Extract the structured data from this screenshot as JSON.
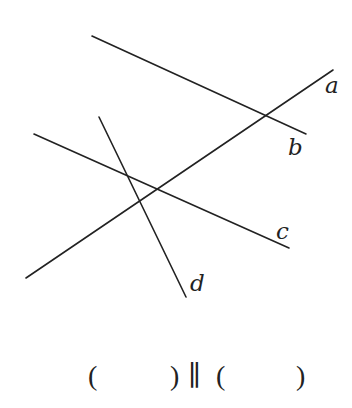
{
  "diagram": {
    "stroke_color": "#222222",
    "lines": [
      {
        "name": "a",
        "x1": 26,
        "y1": 278,
        "x2": 333,
        "y2": 70
      },
      {
        "name": "b",
        "x1": 92,
        "y1": 36,
        "x2": 306,
        "y2": 134
      },
      {
        "name": "c",
        "x1": 34,
        "y1": 134,
        "x2": 289,
        "y2": 248
      },
      {
        "name": "d",
        "x1": 99,
        "y1": 117,
        "x2": 186,
        "y2": 297
      }
    ],
    "labels": {
      "a": "a",
      "b": "b",
      "c": "c",
      "d": "d"
    }
  },
  "answer": {
    "left_open": "(",
    "left_close": ")",
    "parallel_symbol": "∥",
    "right_open": "(",
    "right_close": ")",
    "left_blank_value": "",
    "right_blank_value": ""
  }
}
